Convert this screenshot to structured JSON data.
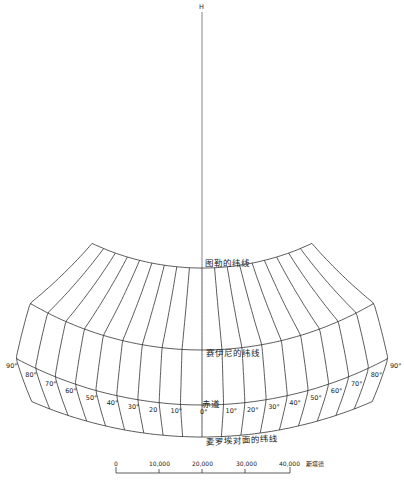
{
  "diagram": {
    "title": "",
    "pole_label": "H",
    "parallels": {
      "top": "图勒的纬线",
      "middle": "赛伊尼的纬线",
      "equator": "赤道",
      "bottom": "麦罗埃对面的纬线"
    },
    "meridian_labels_west": [
      "90°",
      "80°",
      "70°",
      "60°",
      "50°",
      "40°",
      "30°",
      "20",
      "10°"
    ],
    "meridian_label_center": "0°",
    "meridian_labels_east": [
      "10°",
      "20°",
      "30°",
      "40°",
      "50°",
      "60°",
      "70°",
      "80°",
      "90°"
    ],
    "meridian_count": 19,
    "scale_bar": {
      "ticks": [
        "0",
        "10,000",
        "20,000",
        "30,000",
        "40,000"
      ],
      "unit": "斯塔德"
    },
    "colors": {
      "line": "#333333",
      "background": "#ffffff"
    }
  }
}
